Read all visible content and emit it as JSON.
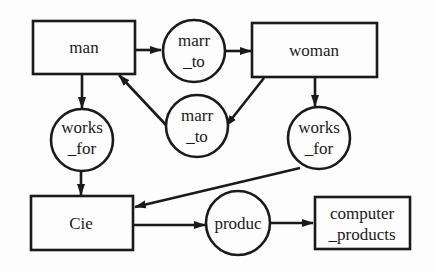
{
  "diagram": {
    "type": "entity-relationship",
    "nodes": [
      {
        "id": "man",
        "kind": "entity",
        "label": "man"
      },
      {
        "id": "woman",
        "kind": "entity",
        "label": "woman"
      },
      {
        "id": "cie",
        "kind": "entity",
        "label": "Cie"
      },
      {
        "id": "computer_products",
        "kind": "entity",
        "label_line1": "computer",
        "label_line2": "_products"
      },
      {
        "id": "marr_to_1",
        "kind": "relationship",
        "label_line1": "marr",
        "label_line2": "_to"
      },
      {
        "id": "marr_to_2",
        "kind": "relationship",
        "label_line1": "marr",
        "label_line2": "_to"
      },
      {
        "id": "works_for_1",
        "kind": "relationship",
        "label_line1": "works",
        "label_line2": "_for"
      },
      {
        "id": "works_for_2",
        "kind": "relationship",
        "label_line1": "works",
        "label_line2": "_for"
      },
      {
        "id": "produc",
        "kind": "relationship",
        "label": "produc"
      }
    ],
    "edges": [
      {
        "from": "man",
        "to": "marr_to_1"
      },
      {
        "from": "marr_to_1",
        "to": "woman"
      },
      {
        "from": "woman",
        "to": "marr_to_2"
      },
      {
        "from": "marr_to_2",
        "to": "man"
      },
      {
        "from": "man",
        "to": "works_for_1"
      },
      {
        "from": "works_for_1",
        "to": "cie"
      },
      {
        "from": "woman",
        "to": "works_for_2"
      },
      {
        "from": "works_for_2",
        "to": "cie"
      },
      {
        "from": "cie",
        "to": "produc"
      },
      {
        "from": "produc",
        "to": "computer_products"
      }
    ]
  }
}
